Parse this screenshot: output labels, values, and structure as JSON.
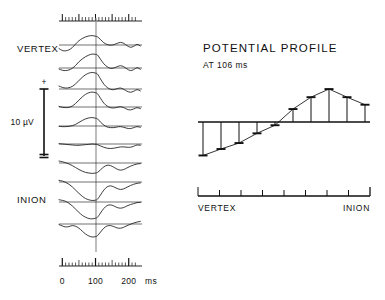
{
  "figure": {
    "background": "#ffffff",
    "ink": "#111111",
    "trace_color": "#1a1a1a"
  },
  "left_panel": {
    "name": "evoked-potential-traces",
    "top_label": "VERTEX",
    "bottom_label": "INION",
    "calibration": {
      "plus_sign": "+",
      "minus_sign": "–",
      "amplitude_label": "10 µV"
    },
    "time_axis": {
      "unit_label": "ms",
      "tick_labels": [
        "0",
        "100",
        "200"
      ],
      "tick_values": [
        0,
        100,
        200
      ],
      "range_ms": [
        -10,
        240
      ],
      "minor_tick_step_ms": 10,
      "major_tick_step_ms": 50,
      "marker_time_ms": 106,
      "marker_label": "106"
    }
  },
  "right_panel": {
    "name": "potential-profile",
    "title": "POTENTIAL PROFILE",
    "subtitle": "AT 106 ms",
    "axis_left_label": "VERTEX",
    "axis_right_label": "INION",
    "electrode_tick_count": 9
  },
  "chart_data": [
    {
      "type": "line",
      "name": "evoked-potential-waveforms",
      "title": "",
      "xlabel": "ms",
      "ylabel": "10 µV",
      "xlim": [
        -10,
        240
      ],
      "grid": false,
      "legend": null,
      "note": "Ten stacked averaged evoked-potential traces recorded along the midline from VERTEX (top) to INION (bottom). Values are amplitude in microvolts relative to each trace baseline; negative is plotted downward.",
      "x": [
        -10,
        0,
        10,
        20,
        30,
        40,
        50,
        60,
        70,
        80,
        90,
        100,
        106,
        115,
        125,
        135,
        145,
        155,
        165,
        175,
        185,
        195,
        205,
        215,
        225,
        235
      ],
      "series": [
        {
          "name": "trace-1-vertex",
          "site_index": 1,
          "values": [
            2.2,
            3.4,
            3.6,
            3.0,
            1.6,
            -0.6,
            -2.6,
            -4.0,
            -5.0,
            -5.6,
            -5.8,
            -5.4,
            -5.0,
            -3.4,
            -1.4,
            -0.3,
            0.1,
            -0.2,
            -1.0,
            -1.6,
            -1.0,
            0.4,
            1.4,
            0.8,
            -0.4,
            0.6
          ]
        },
        {
          "name": "trace-2",
          "site_index": 2,
          "values": [
            0.6,
            1.4,
            1.6,
            1.2,
            0.2,
            -1.6,
            -3.8,
            -5.6,
            -7.0,
            -8.0,
            -8.6,
            -8.4,
            -8.0,
            -5.4,
            -2.6,
            -0.8,
            0.2,
            0.0,
            -0.8,
            -1.4,
            -0.8,
            0.6,
            1.6,
            1.0,
            -0.2,
            0.8
          ]
        },
        {
          "name": "trace-3",
          "site_index": 3,
          "values": [
            -1.8,
            -1.0,
            -0.6,
            -0.8,
            -1.6,
            -3.2,
            -5.2,
            -7.2,
            -8.8,
            -9.8,
            -10.2,
            -9.8,
            -9.2,
            -6.2,
            -3.0,
            -1.0,
            0.2,
            0.4,
            -0.2,
            -0.6,
            0.2,
            1.4,
            2.0,
            1.4,
            0.4,
            1.2
          ]
        },
        {
          "name": "trace-4",
          "site_index": 4,
          "values": [
            -0.4,
            0.2,
            0.4,
            0.2,
            -0.6,
            -2.2,
            -4.2,
            -6.2,
            -7.8,
            -8.8,
            -9.2,
            -8.8,
            -8.2,
            -5.4,
            -2.4,
            -0.6,
            0.4,
            0.6,
            0.2,
            -0.2,
            0.4,
            1.4,
            1.8,
            1.2,
            0.4,
            1.0
          ]
        },
        {
          "name": "trace-5",
          "site_index": 5,
          "values": [
            0.2,
            0.4,
            0.4,
            0.2,
            -0.2,
            -1.0,
            -2.2,
            -3.4,
            -4.4,
            -5.0,
            -5.2,
            -4.8,
            -4.4,
            -2.4,
            -0.6,
            0.6,
            1.0,
            1.0,
            0.6,
            0.4,
            0.8,
            1.4,
            1.6,
            1.0,
            0.4,
            0.8
          ]
        },
        {
          "name": "trace-6",
          "site_index": 6,
          "values": [
            -0.2,
            0.0,
            0.2,
            0.4,
            0.6,
            0.8,
            0.8,
            0.6,
            0.4,
            0.2,
            0.0,
            0.2,
            0.4,
            1.2,
            2.0,
            2.6,
            2.8,
            2.6,
            2.2,
            1.8,
            1.8,
            2.0,
            2.0,
            1.4,
            0.6,
            0.8
          ]
        },
        {
          "name": "trace-7",
          "site_index": 7,
          "values": [
            -1.2,
            -0.8,
            -0.2,
            0.6,
            1.6,
            2.8,
            4.0,
            5.0,
            5.8,
            6.2,
            6.4,
            6.2,
            5.8,
            4.2,
            2.4,
            1.4,
            1.6,
            2.6,
            3.8,
            4.4,
            4.0,
            3.0,
            2.0,
            1.2,
            0.6,
            0.4
          ]
        },
        {
          "name": "trace-8",
          "site_index": 8,
          "values": [
            -1.0,
            -0.6,
            0.2,
            1.4,
            3.0,
            5.0,
            7.0,
            8.8,
            10.2,
            11.0,
            11.4,
            11.2,
            10.6,
            8.0,
            5.0,
            3.0,
            2.4,
            3.0,
            4.0,
            4.6,
            4.2,
            3.2,
            2.2,
            1.4,
            0.8,
            0.6
          ]
        },
        {
          "name": "trace-9",
          "site_index": 9,
          "values": [
            -1.4,
            -1.0,
            -0.4,
            0.8,
            2.4,
            4.4,
            6.4,
            8.2,
            9.4,
            10.2,
            10.4,
            10.0,
            9.4,
            6.8,
            4.0,
            2.2,
            1.8,
            2.4,
            3.4,
            3.8,
            3.4,
            2.4,
            1.6,
            1.0,
            0.4,
            0.2
          ]
        },
        {
          "name": "trace-10-inion",
          "site_index": 10,
          "values": [
            0.4,
            1.2,
            1.8,
            1.6,
            1.0,
            1.4,
            2.6,
            4.4,
            6.2,
            7.4,
            8.0,
            7.8,
            7.2,
            5.0,
            2.6,
            1.2,
            1.0,
            1.6,
            2.4,
            2.6,
            2.0,
            1.0,
            0.2,
            -0.6,
            -1.2,
            -1.6
          ]
        }
      ]
    },
    {
      "type": "bar",
      "name": "potential-profile-at-106ms",
      "title": "POTENTIAL PROFILE",
      "subtitle": "AT 106 ms",
      "xlabel": "",
      "ylabel": "",
      "grid": false,
      "legend": null,
      "note": "Amplitude at 106 ms plotted against recording site from VERTEX to INION. Bars hang below the zero baseline for negative values and rise above it for positive values; each bar ends in a short horizontal cap and the caps are joined by a connecting line.",
      "categories": [
        "VERTEX",
        "2",
        "3",
        "4",
        "5",
        "6",
        "7",
        "8",
        "9",
        "INION"
      ],
      "values": [
        -6.2,
        -5.0,
        -3.9,
        -2.1,
        -0.6,
        2.4,
        4.6,
        6.1,
        4.6,
        3.2
      ],
      "ylim": [
        -7.5,
        7.5
      ],
      "baseline": 0
    }
  ]
}
